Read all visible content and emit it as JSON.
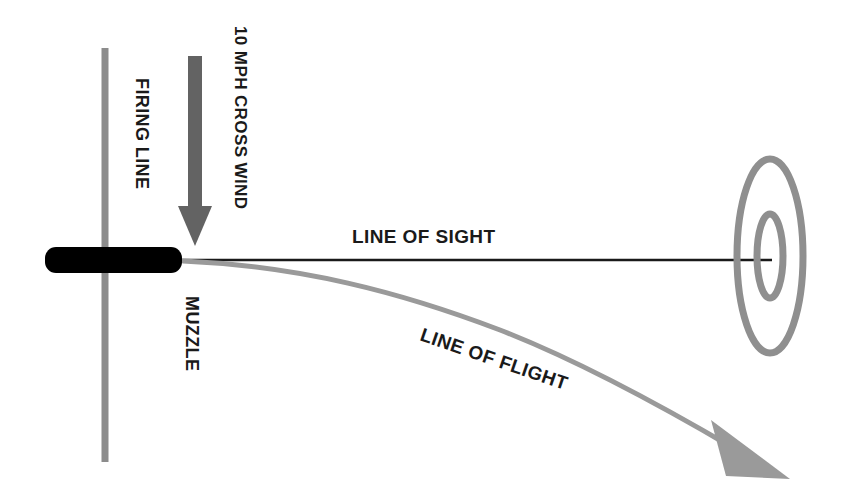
{
  "diagram": {
    "background_color": "#ffffff",
    "labels": {
      "firing_line": "FIRING LINE",
      "cross_wind": "10 MPH CROSS WIND",
      "muzzle": "MUZZLE",
      "line_of_sight": "LINE OF SIGHT",
      "line_of_flight": "LINE OF FLIGHT"
    },
    "colors": {
      "firing_line": "#8c8c8c",
      "wind_arrow": "#636363",
      "barrel": "#000000",
      "line_of_sight": "#1a1a1a",
      "line_of_flight": "#9a9a9a",
      "target_ring": "#8f8f8f",
      "text": "#1a1a1a"
    },
    "elements": {
      "firing_line": {
        "name": "firing-line",
        "orientation": "vertical",
        "x": 105,
        "y_top": 48,
        "y_bottom": 462,
        "thickness": 7
      },
      "wind_arrow": {
        "name": "cross-wind-arrow",
        "direction": "down",
        "x": 195,
        "y_top": 56,
        "y_tip": 246,
        "shaft_width": 14,
        "head_width": 34,
        "head_height": 40
      },
      "barrel": {
        "name": "rifle-barrel",
        "x": 45,
        "y": 247,
        "width": 137,
        "height": 26,
        "corner_radius": 11
      },
      "line_of_sight": {
        "name": "line-of-sight",
        "x_start": 181,
        "x_end": 772,
        "y": 260,
        "thickness": 2.4
      },
      "line_of_flight": {
        "name": "line-of-flight",
        "thickness": 5,
        "path_points": [
          [
            183,
            261
          ],
          [
            300,
            272
          ],
          [
            420,
            302
          ],
          [
            545,
            345
          ],
          [
            650,
            394
          ],
          [
            726,
            438
          ]
        ],
        "arrow_tip": [
          795,
          480
        ],
        "arrow_angle_deg": 45
      },
      "target": {
        "name": "target-rings",
        "center_x": 770,
        "center_y": 256,
        "outer_rx": 36,
        "outer_ry": 100,
        "inner_rx": 15,
        "inner_ry": 44,
        "ring_thickness": 7
      }
    },
    "label_positions": {
      "firing_line": {
        "x": 136,
        "y": 78,
        "rotate": 90
      },
      "cross_wind": {
        "x": 235,
        "y": 26,
        "rotate": 90
      },
      "muzzle": {
        "x": 186,
        "y": 296,
        "rotate": 90
      },
      "line_of_sight": {
        "x": 352,
        "y": 243,
        "rotate": 0
      },
      "line_of_flight": {
        "x": 419,
        "y": 340,
        "rotate": 19
      }
    }
  }
}
